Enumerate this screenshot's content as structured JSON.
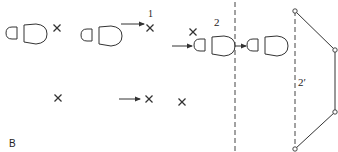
{
  "diagram": {
    "panel_label": "B",
    "labels": {
      "step1": "1",
      "step2": "2",
      "step2_prime": "2′"
    },
    "stroke_color": "#333333",
    "elements": {
      "footprints": [
        {
          "id": "fp1",
          "x": 5,
          "y": 22
        },
        {
          "id": "fp2",
          "x": 80,
          "y": 24
        },
        {
          "id": "fp3",
          "x": 196,
          "y": 35
        },
        {
          "id": "fp4",
          "x": 247,
          "y": 35
        }
      ],
      "crosses": [
        {
          "id": "c1",
          "x": 57,
          "y": 28
        },
        {
          "id": "c2",
          "x": 150,
          "y": 28
        },
        {
          "id": "c3",
          "x": 193,
          "y": 32
        },
        {
          "id": "c4",
          "x": 58,
          "y": 98
        },
        {
          "id": "c5",
          "x": 149,
          "y": 99
        },
        {
          "id": "c6",
          "x": 182,
          "y": 102
        }
      ],
      "arrows": [
        {
          "id": "a1",
          "from": [
            121,
            24
          ],
          "to": [
            143,
            24
          ]
        },
        {
          "id": "a2",
          "from": [
            173,
            47
          ],
          "to": [
            193,
            47
          ]
        },
        {
          "id": "a3",
          "from": [
            235,
            47
          ],
          "to": [
            245,
            47
          ]
        },
        {
          "id": "a4",
          "from": [
            119,
            99
          ],
          "to": [
            140,
            99
          ]
        }
      ],
      "polygon_points": [
        [
          295,
          11
        ],
        [
          335,
          50
        ],
        [
          335,
          112
        ],
        [
          295,
          149
        ]
      ]
    }
  }
}
